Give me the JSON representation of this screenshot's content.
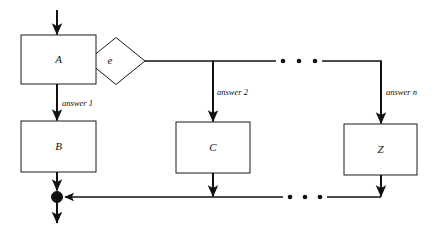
{
  "diagram": {
    "type": "flowchart",
    "title": "",
    "nodes": [
      {
        "id": "A",
        "label": "A",
        "shape": "rect",
        "x": 21,
        "y": 35,
        "w": 75,
        "h": 49
      },
      {
        "id": "e",
        "label": "e",
        "shape": "diamond",
        "cx": 116,
        "cy": 61,
        "rx": 29,
        "ry": 24
      },
      {
        "id": "B",
        "label": "B",
        "shape": "rect",
        "x": 21,
        "y": 121,
        "w": 75,
        "h": 51
      },
      {
        "id": "C",
        "label": "C",
        "shape": "rect",
        "x": 176,
        "y": 122,
        "w": 74,
        "h": 51
      },
      {
        "id": "Z",
        "label": "Z",
        "shape": "rect",
        "x": 344,
        "y": 124,
        "w": 73,
        "h": 51
      }
    ],
    "edge_labels": [
      {
        "id": "answer-1",
        "text": "answer 1",
        "x": 62,
        "y": 104
      },
      {
        "id": "answer-2",
        "text": "answer 2",
        "x": 217,
        "y": 93
      },
      {
        "id": "answer-n",
        "text": "answer n",
        "x": 386,
        "y": 93
      }
    ],
    "ellipsis": [
      {
        "id": "top-ellipsis",
        "y": 61,
        "dots_x": [
          283,
          299,
          315
        ]
      },
      {
        "id": "bottom-ellipsis",
        "y": 197,
        "dots_x": [
          290,
          305,
          320
        ]
      }
    ],
    "merge_node": {
      "id": "merge-point",
      "cx": 57,
      "cy": 197,
      "r": 5.5
    },
    "entry_arrow": {
      "x": 57,
      "from_y": 10,
      "to_y": 35
    },
    "exit_arrow": {
      "x": 57,
      "from_y": 202,
      "to_y": 224
    },
    "branch_x": {
      "answer1": 57,
      "answer2": 213,
      "answern": 381
    },
    "rails": {
      "top_y": 61,
      "bottom_y": 197
    },
    "colors": {
      "stroke": "#1a1a1a",
      "line": "#111111",
      "fill": "#ffffff",
      "background": "#ffffff"
    }
  }
}
